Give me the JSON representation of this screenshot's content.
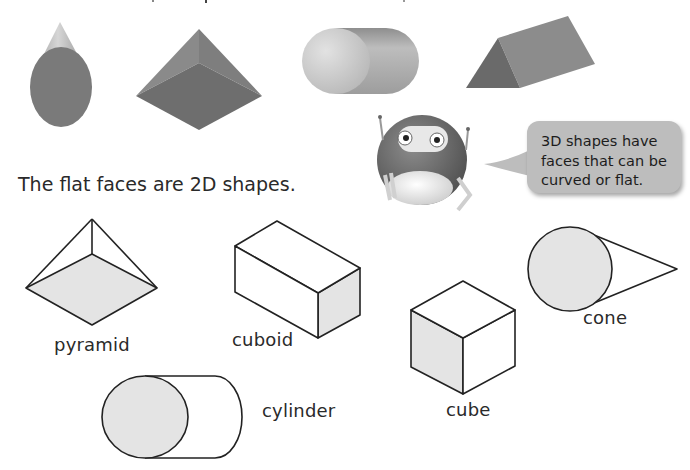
{
  "page": {
    "topic": "3D shapes and their flat faces",
    "colors": {
      "shape_3d_dark": "#777777",
      "shape_3d_light": "#bdbdbd",
      "face_fill": "#e4e4e4",
      "outline": "#222222",
      "bubble_bg": "#bdbdbd"
    }
  },
  "solids_row": {
    "items": [
      {
        "name": "cone"
      },
      {
        "name": "square-based pyramid"
      },
      {
        "name": "cylinder"
      },
      {
        "name": "triangular prism"
      }
    ]
  },
  "speech_bubble": {
    "lines": [
      "3D shapes have",
      "faces that can be",
      "curved or flat."
    ]
  },
  "heading": "The flat faces are 2D shapes.",
  "labels": {
    "pyramid": "pyramid",
    "cuboid": "cuboid",
    "cone": "cone",
    "cube": "cube",
    "cylinder": "cylinder"
  }
}
